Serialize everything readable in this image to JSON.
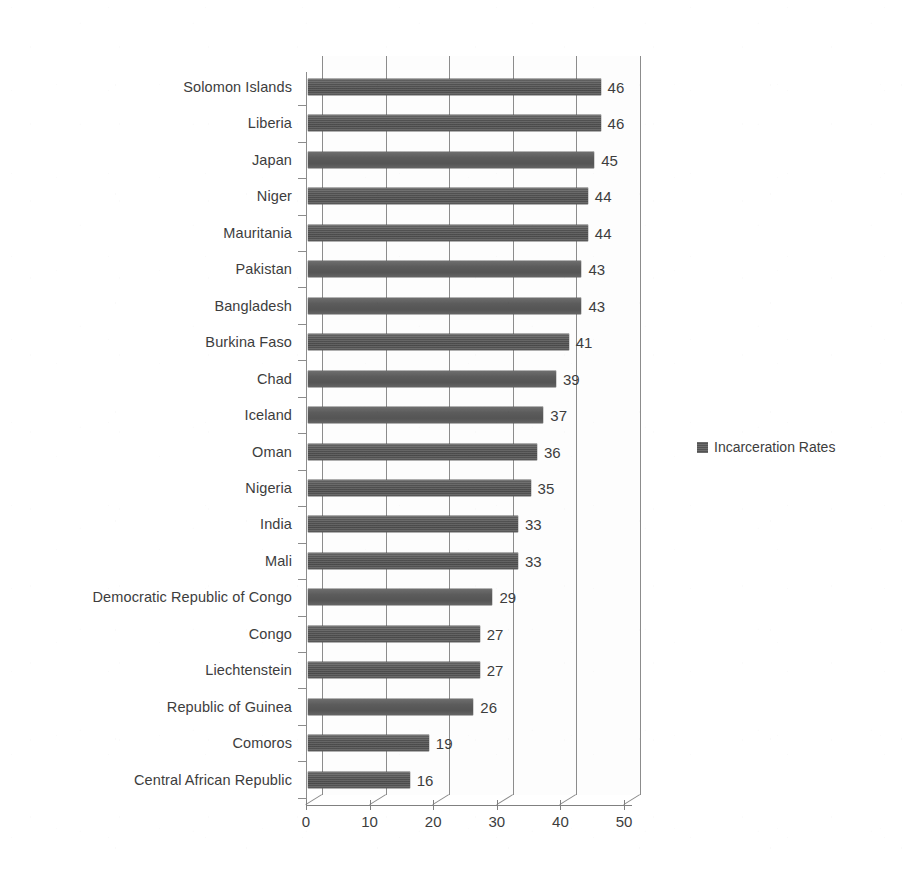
{
  "chart_data": {
    "type": "bar",
    "orientation": "horizontal",
    "title": "",
    "subtitle": "",
    "xlabel": "",
    "ylabel": "",
    "xlim": [
      0,
      50
    ],
    "xticks": [
      "0",
      "10",
      "20",
      "30",
      "40",
      "50"
    ],
    "grid": true,
    "legend_position": "right",
    "series": [
      {
        "name": "Incarceration Rates",
        "color": "#595959",
        "values": [
          46,
          46,
          45,
          44,
          44,
          43,
          43,
          41,
          39,
          37,
          36,
          35,
          33,
          33,
          29,
          27,
          27,
          26,
          19,
          16
        ]
      }
    ],
    "categories": [
      "Solomon Islands",
      "Liberia",
      "Japan",
      "Niger",
      "Mauritania",
      "Pakistan",
      "Bangladesh",
      "Burkina Faso",
      "Chad",
      "Iceland",
      "Oman",
      "Nigeria",
      "India",
      "Mali",
      "Democratic Republic of Congo",
      "Congo",
      "Liechtenstein",
      "Republic of Guinea",
      "Comoros",
      "Central African Republic"
    ],
    "data_labels": [
      "46",
      "46",
      "45",
      "44",
      "44",
      "43",
      "43",
      "41",
      "39",
      "37",
      "36",
      "35",
      "33",
      "33",
      "29",
      "27",
      "27",
      "26",
      "19",
      "16"
    ]
  },
  "legend": {
    "entries": [
      {
        "label": "Incarceration Rates",
        "color": "#595959"
      }
    ]
  },
  "colors": {
    "bar": "#595959",
    "axis": "#8c8c8c",
    "text": "#3d3d3d",
    "background": "#ffffff"
  }
}
